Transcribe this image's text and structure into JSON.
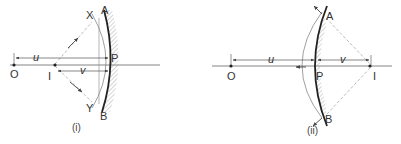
{
  "figures": [
    {
      "id": "i",
      "caption": "(i)",
      "mirror_type": "concave",
      "labels": {
        "object": "O",
        "image": "I",
        "pole": "P",
        "top_end": "A",
        "bottom_end": "B",
        "ray_top": "X",
        "ray_bottom": "Y",
        "object_distance": "u",
        "image_distance": "v"
      }
    },
    {
      "id": "ii",
      "caption": "(ii)",
      "mirror_type": "convex",
      "labels": {
        "object": "O",
        "image": "I",
        "pole": "P",
        "top_end": "A",
        "bottom_end": "B",
        "object_distance": "u",
        "image_distance": "v"
      }
    }
  ],
  "colors": {
    "line": "#555555",
    "mirror": "#222222",
    "dashed": "#aaaaaa",
    "hatch": "#999999"
  }
}
